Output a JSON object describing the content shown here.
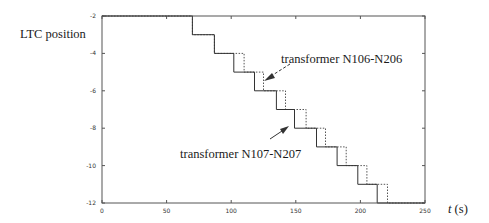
{
  "chart_data": {
    "type": "line",
    "subtype": "step",
    "title": "",
    "xlabel_var": "t",
    "xlabel_unit": "(s)",
    "xlabel": "t (s)",
    "ylabel": "LTC position",
    "xlim": [
      0,
      250
    ],
    "ylim": [
      -12,
      -2
    ],
    "xticks": [
      0,
      50,
      100,
      150,
      200,
      250
    ],
    "yticks": [
      -2,
      -4,
      -6,
      -8,
      -10,
      -12
    ],
    "grid": false,
    "legend": null,
    "series": [
      {
        "name": "transformer N107-N207",
        "style": "solid",
        "color": "#333333",
        "step_times": [
          70,
          87,
          102,
          118,
          135,
          149,
          166,
          182,
          198,
          213
        ],
        "x": [
          0,
          70,
          70,
          87,
          87,
          102,
          102,
          118,
          118,
          135,
          135,
          149,
          149,
          166,
          166,
          182,
          182,
          198,
          198,
          213,
          213,
          250
        ],
        "y": [
          -2,
          -2,
          -3,
          -3,
          -4,
          -4,
          -5,
          -5,
          -6,
          -6,
          -7,
          -7,
          -8,
          -8,
          -9,
          -9,
          -10,
          -10,
          -11,
          -11,
          -12,
          -12
        ]
      },
      {
        "name": "transformer N106-N206",
        "style": "dotted",
        "color": "#555555",
        "step_times": [
          70,
          87,
          110,
          125,
          142,
          158,
          173,
          189,
          205,
          221
        ],
        "x": [
          0,
          70,
          70,
          87,
          87,
          110,
          110,
          125,
          125,
          142,
          142,
          158,
          158,
          173,
          173,
          189,
          189,
          205,
          205,
          221,
          221,
          250
        ],
        "y": [
          -2,
          -2,
          -3,
          -3,
          -4,
          -4,
          -5,
          -5,
          -6,
          -6,
          -7,
          -7,
          -8,
          -8,
          -9,
          -9,
          -10,
          -10,
          -11,
          -11,
          -12,
          -12
        ]
      }
    ],
    "annotations": [
      {
        "text": "transformer N106-N206",
        "arrow": "dashed",
        "points_to_series": "transformer N106-N206"
      },
      {
        "text": "transformer N107-N207",
        "arrow": "solid",
        "points_to_series": "transformer N107-N207"
      }
    ]
  },
  "labels": {
    "ylabel": "LTC position",
    "xlabel_var": "t",
    "xlabel_unit": "(s)",
    "annot_n106": "transformer N106-N206",
    "annot_n107": "transformer N107-N207"
  }
}
